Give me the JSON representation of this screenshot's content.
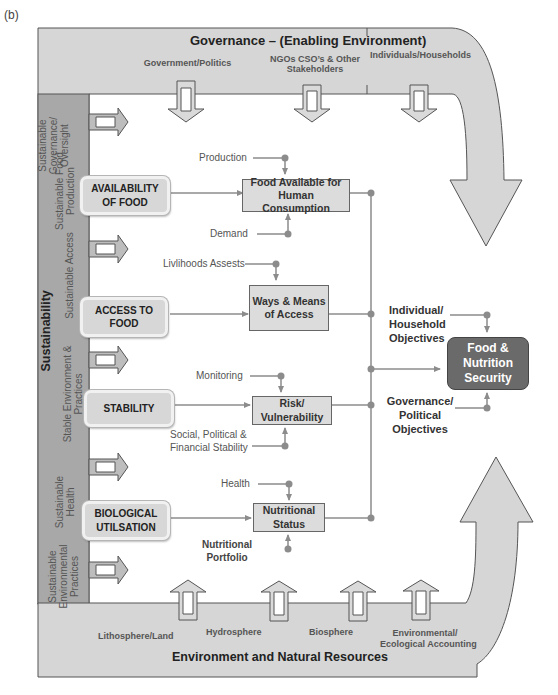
{
  "figure_label": "(b)",
  "governance": {
    "title": "Governance – (Enabling Environment)",
    "items": [
      "Government/Politics",
      "NGOs CSO’s & Other Stakeholders",
      "Individuals/Households"
    ],
    "item_lines": {
      "government": "Government/Politics",
      "ngo_line1": "NGOs CSO’s & Other",
      "ngo_line2": "Stakeholders",
      "individuals": "Individuals/Households"
    }
  },
  "environment": {
    "title": "Environment and Natural Resources",
    "items": [
      "Lithosphere/Land",
      "Hydrosphere",
      "Biosphere",
      "Environmental/ Ecological Accounting"
    ],
    "item_lines": {
      "lithosphere": "Lithosphere/Land",
      "hydrosphere": "Hydrosphere",
      "biosphere": "Biosphere",
      "eco_line1": "Environmental/",
      "eco_line2": "Ecological Accounting"
    }
  },
  "sustainability": {
    "title": "Sustainability",
    "sections": [
      {
        "line1": "Sustainable",
        "line2": "Governance/",
        "line3": "Oversight"
      },
      {
        "line1": "Sustainable Food",
        "line2": "Production"
      },
      {
        "line1": "Sustainable Access"
      },
      {
        "line1": "Stable Environment &",
        "line2": "Practices"
      },
      {
        "line1": "Sustainable",
        "line2": "Health"
      },
      {
        "line1": "Sustainable",
        "line2": "Environmental",
        "line3": "Practices"
      }
    ]
  },
  "pillars": [
    {
      "line1": "AVAILABILITY",
      "line2": "OF FOOD"
    },
    {
      "line1": "ACCESS TO",
      "line2": "FOOD"
    },
    {
      "line1": "STABILITY"
    },
    {
      "line1": "BIOLOGICAL",
      "line2": "UTILSATION"
    }
  ],
  "outcomes": [
    {
      "line1": "Food Available for",
      "line2": "Human Consumption",
      "inputs_above": "Production",
      "inputs_below": "Demand"
    },
    {
      "line1": "Ways & Means",
      "line2": "of Access",
      "inputs_above": "Livlihoods Assests"
    },
    {
      "line1": "Risk/",
      "line2": "Vulnerability",
      "inputs_above": "Monitoring",
      "inputs_below_line1": "Social, Political &",
      "inputs_below_line2": "Financial Stability"
    },
    {
      "line1": "Nutritional",
      "line2": "Status",
      "inputs_above": "Health",
      "inputs_below_line1": "Nutritional",
      "inputs_below_line2": "Portfolio"
    }
  ],
  "goal": {
    "line1": "Food &",
    "line2": "Nutrition",
    "line3": "Security",
    "objective_above": {
      "line1": "Individual/",
      "line2": "Household",
      "line3": "Objectives"
    },
    "objective_below": {
      "line1": "Governance/",
      "line2": "Political",
      "line3": "Objectives"
    }
  },
  "colors": {
    "band_fill": "#d6d6d6",
    "sidebar_fill": "#a8a8a8",
    "outline": "#555555",
    "connector": "#8c8c8c",
    "goal_fill": "#6a6a6a"
  }
}
